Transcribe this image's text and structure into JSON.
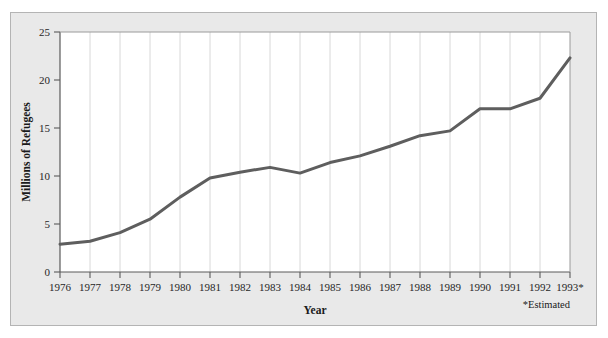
{
  "chart_data": {
    "type": "line",
    "title": "",
    "xlabel": "Year",
    "ylabel": "Millions of Refugees",
    "xlim": [
      1976,
      1993
    ],
    "ylim": [
      0,
      25
    ],
    "grid": true,
    "legend": "none",
    "annotation": "*Estimated",
    "categories": [
      "1976",
      "1977",
      "1978",
      "1979",
      "1980",
      "1981",
      "1982",
      "1983",
      "1984",
      "1985",
      "1986",
      "1987",
      "1988",
      "1989",
      "1990",
      "1991",
      "1992",
      "1993*"
    ],
    "x_tick_labels": [
      "1976",
      "1977",
      "1978",
      "1979",
      "1980",
      "1981",
      "1982",
      "1983",
      "1984",
      "1985",
      "1986",
      "1987",
      "1988",
      "1989",
      "1990",
      "1991",
      "1992",
      "1993*"
    ],
    "y_tick_labels": [
      "0",
      "5",
      "10",
      "15",
      "20",
      "25"
    ],
    "y_ticks": [
      0,
      5,
      10,
      15,
      20,
      25
    ],
    "series": [
      {
        "name": "Refugees",
        "color": "#5e5e5e",
        "values": [
          2.9,
          3.2,
          4.1,
          5.5,
          7.8,
          9.8,
          10.4,
          10.9,
          10.3,
          11.4,
          12.1,
          13.1,
          14.2,
          14.7,
          17.0,
          17.0,
          18.1,
          22.3
        ]
      }
    ],
    "colors": {
      "line": "#5e5e5e",
      "figure_background": "#e9e9e9",
      "plot_background": "#ffffff",
      "grid": "#d4d4d4",
      "axis": "#5a5a5a",
      "text": "#1a1a1a"
    }
  }
}
